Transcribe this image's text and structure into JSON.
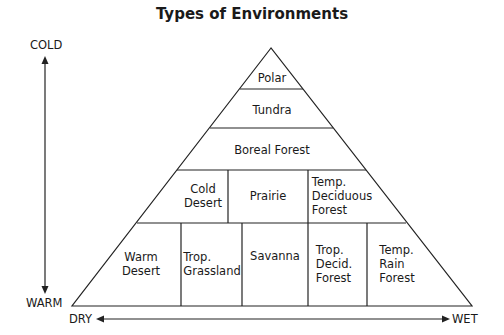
{
  "title": "Types of Environments",
  "axes": {
    "vertical": {
      "top": "COLD",
      "bottom": "WARM"
    },
    "horizontal": {
      "left": "DRY",
      "right": "WET"
    }
  },
  "regions": {
    "row1": [
      {
        "label": "Polar"
      }
    ],
    "row2": [
      {
        "label": "Tundra"
      }
    ],
    "row3": [
      {
        "label": "Boreal Forest"
      }
    ],
    "row4": [
      {
        "label": "Cold\nDesert"
      },
      {
        "label": "Prairie"
      },
      {
        "label": "Temp.\nDeciduous\nForest"
      }
    ],
    "row5": [
      {
        "label": "Warm\nDesert"
      },
      {
        "label": "Trop.\nGrassland"
      },
      {
        "label": "Savanna"
      },
      {
        "label": "Trop.\nDecid.\nForest"
      },
      {
        "label": "Temp.\nRain\nForest"
      }
    ]
  }
}
